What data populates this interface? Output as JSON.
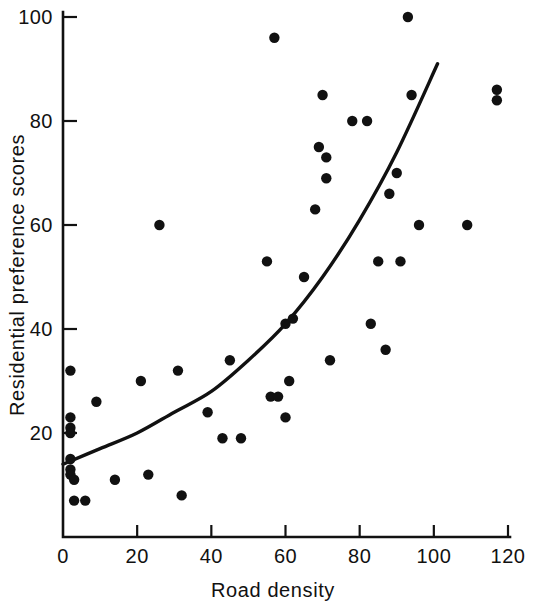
{
  "chart_data": {
    "type": "scatter",
    "title": "",
    "xlabel": "Road density",
    "ylabel": "Residential preference scores",
    "xlim": [
      0,
      123
    ],
    "ylim": [
      0,
      104
    ],
    "xticks": [
      0,
      20,
      40,
      60,
      80,
      100,
      120
    ],
    "yticks": [
      20,
      40,
      60,
      80,
      100
    ],
    "xtick_labels": [
      "0",
      "20",
      "40",
      "60",
      "80",
      "100",
      "120"
    ],
    "ytick_labels": [
      "20",
      "40",
      "60",
      "80",
      "100"
    ],
    "grid": false,
    "legend": null,
    "marker_color": "#111111",
    "line_color": "#111111",
    "points": [
      {
        "x": 2,
        "y": 32
      },
      {
        "x": 2,
        "y": 23
      },
      {
        "x": 2,
        "y": 21
      },
      {
        "x": 2,
        "y": 20
      },
      {
        "x": 2,
        "y": 15
      },
      {
        "x": 2,
        "y": 13
      },
      {
        "x": 2,
        "y": 12
      },
      {
        "x": 3,
        "y": 11
      },
      {
        "x": 3,
        "y": 7
      },
      {
        "x": 6,
        "y": 7
      },
      {
        "x": 9,
        "y": 26
      },
      {
        "x": 14,
        "y": 11
      },
      {
        "x": 21,
        "y": 30
      },
      {
        "x": 23,
        "y": 12
      },
      {
        "x": 26,
        "y": 60
      },
      {
        "x": 31,
        "y": 32
      },
      {
        "x": 32,
        "y": 8
      },
      {
        "x": 39,
        "y": 24
      },
      {
        "x": 43,
        "y": 19
      },
      {
        "x": 45,
        "y": 34
      },
      {
        "x": 48,
        "y": 19
      },
      {
        "x": 55,
        "y": 53
      },
      {
        "x": 56,
        "y": 27
      },
      {
        "x": 57,
        "y": 96
      },
      {
        "x": 58,
        "y": 27
      },
      {
        "x": 60,
        "y": 41
      },
      {
        "x": 60,
        "y": 23
      },
      {
        "x": 61,
        "y": 30
      },
      {
        "x": 62,
        "y": 42
      },
      {
        "x": 65,
        "y": 50
      },
      {
        "x": 68,
        "y": 63
      },
      {
        "x": 69,
        "y": 75
      },
      {
        "x": 70,
        "y": 85
      },
      {
        "x": 71,
        "y": 73
      },
      {
        "x": 71,
        "y": 69
      },
      {
        "x": 72,
        "y": 34
      },
      {
        "x": 78,
        "y": 80
      },
      {
        "x": 82,
        "y": 80
      },
      {
        "x": 83,
        "y": 41
      },
      {
        "x": 85,
        "y": 53
      },
      {
        "x": 87,
        "y": 36
      },
      {
        "x": 88,
        "y": 66
      },
      {
        "x": 90,
        "y": 70
      },
      {
        "x": 91,
        "y": 53
      },
      {
        "x": 93,
        "y": 100
      },
      {
        "x": 94,
        "y": 85
      },
      {
        "x": 96,
        "y": 60
      },
      {
        "x": 109,
        "y": 60
      },
      {
        "x": 117,
        "y": 86
      },
      {
        "x": 117,
        "y": 84
      }
    ],
    "fit_curve": {
      "description": "exponential fitted trend line",
      "start": {
        "x": 0,
        "y": 14
      },
      "end": {
        "x": 101,
        "y": 91
      },
      "path_points": [
        {
          "x": 0,
          "y": 14
        },
        {
          "x": 10,
          "y": 17
        },
        {
          "x": 20,
          "y": 20
        },
        {
          "x": 30,
          "y": 24
        },
        {
          "x": 40,
          "y": 28
        },
        {
          "x": 50,
          "y": 34
        },
        {
          "x": 60,
          "y": 41
        },
        {
          "x": 70,
          "y": 50
        },
        {
          "x": 80,
          "y": 61
        },
        {
          "x": 90,
          "y": 74
        },
        {
          "x": 101,
          "y": 91
        }
      ]
    }
  },
  "axes": {
    "x_axis_name": "road-density-axis",
    "y_axis_name": "residential-preference-scores-axis"
  }
}
